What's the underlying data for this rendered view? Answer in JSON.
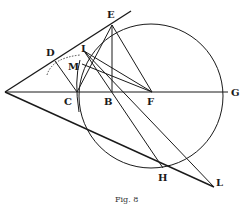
{
  "figure": {
    "caption": "Fig. 8",
    "points": {
      "A": {
        "x": 5,
        "y": 92
      },
      "C": {
        "x": 77,
        "y": 92,
        "label": "C"
      },
      "B": {
        "x": 112,
        "y": 92,
        "label": "B"
      },
      "F": {
        "x": 152,
        "y": 92,
        "label": "F"
      },
      "G": {
        "x": 228,
        "y": 92,
        "label": "G"
      },
      "E": {
        "x": 112,
        "y": 24,
        "label": "E"
      },
      "D": {
        "x": 55,
        "y": 61,
        "label": "D"
      },
      "I": {
        "x": 84,
        "y": 50,
        "label": "I"
      },
      "M": {
        "x": 80,
        "y": 66,
        "label": "M"
      },
      "H": {
        "x": 163,
        "y": 168,
        "label": "H"
      },
      "L": {
        "x": 214,
        "y": 187,
        "label": "L"
      }
    },
    "circle": {
      "cx": 150,
      "cy": 92,
      "r": 78
    }
  }
}
